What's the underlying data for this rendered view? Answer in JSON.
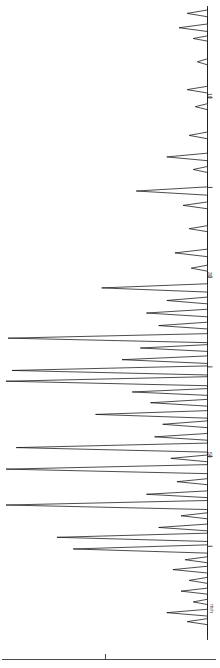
{
  "figure": {
    "orientation": "rotated-90-clockwise",
    "axis_title": "min",
    "baseline_color": "#1a1a1a",
    "trace_color": "#111111",
    "background": "#ffffff"
  },
  "axis": {
    "ticks": [
      {
        "label": "10",
        "t": 10,
        "show_label": true
      },
      {
        "label": "20",
        "t": 20,
        "show_label": false
      },
      {
        "label": "30",
        "t": 30,
        "show_label": true
      },
      {
        "label": "40",
        "t": 40,
        "show_label": false
      },
      {
        "label": "50",
        "t": 50,
        "show_label": true
      },
      {
        "label": "60",
        "t": 60,
        "show_label": false
      }
    ],
    "bottom_rule_tick": "0"
  },
  "chart_data": {
    "type": "line",
    "title": "",
    "subtitle": "",
    "xlabel": "min",
    "ylabel": "",
    "grid": false,
    "legend": "none",
    "orientation": "vertical-time-axis",
    "xlim": [
      0,
      70
    ],
    "ylim": [
      0,
      1
    ],
    "axis_ticks": [
      10,
      20,
      30,
      40,
      50,
      60
    ],
    "axis_tick_labels": [
      "10",
      "20",
      "30",
      "40",
      "50",
      "60"
    ],
    "series": [
      {
        "name": "detector response",
        "peaks": [
          {
            "t": 0.6,
            "h": 0.1,
            "w": 0.9
          },
          {
            "t": 2.2,
            "h": 0.14,
            "w": 1.0
          },
          {
            "t": 3.4,
            "h": 0.07,
            "w": 0.7
          },
          {
            "t": 6.0,
            "h": 0.05,
            "w": 0.8
          },
          {
            "t": 9.1,
            "h": 0.1,
            "w": 0.9
          },
          {
            "t": 11.0,
            "h": 0.06,
            "w": 0.8
          },
          {
            "t": 14.2,
            "h": 0.09,
            "w": 0.9
          },
          {
            "t": 16.6,
            "h": 0.2,
            "w": 1.0
          },
          {
            "t": 18.0,
            "h": 0.07,
            "w": 0.8
          },
          {
            "t": 20.4,
            "h": 0.35,
            "w": 1.1
          },
          {
            "t": 22.0,
            "h": 0.12,
            "w": 0.9
          },
          {
            "t": 24.6,
            "h": 0.09,
            "w": 0.8
          },
          {
            "t": 27.3,
            "h": 0.16,
            "w": 1.0
          },
          {
            "t": 29.0,
            "h": 0.08,
            "w": 0.8
          },
          {
            "t": 31.2,
            "h": 0.52,
            "w": 1.1
          },
          {
            "t": 32.6,
            "h": 0.2,
            "w": 0.9
          },
          {
            "t": 34.0,
            "h": 0.3,
            "w": 1.0
          },
          {
            "t": 35.4,
            "h": 0.24,
            "w": 0.9
          },
          {
            "t": 36.8,
            "h": 0.98,
            "w": 1.2
          },
          {
            "t": 37.9,
            "h": 0.33,
            "w": 0.9
          },
          {
            "t": 39.2,
            "h": 0.42,
            "w": 1.0
          },
          {
            "t": 40.4,
            "h": 0.96,
            "w": 1.2
          },
          {
            "t": 41.6,
            "h": 0.99,
            "w": 1.2
          },
          {
            "t": 42.8,
            "h": 0.37,
            "w": 0.9
          },
          {
            "t": 44.0,
            "h": 0.28,
            "w": 0.9
          },
          {
            "t": 45.3,
            "h": 0.55,
            "w": 1.0
          },
          {
            "t": 46.4,
            "h": 0.22,
            "w": 0.9
          },
          {
            "t": 47.8,
            "h": 0.26,
            "w": 0.9
          },
          {
            "t": 49.0,
            "h": 0.94,
            "w": 1.2
          },
          {
            "t": 50.2,
            "h": 0.18,
            "w": 0.9
          },
          {
            "t": 51.4,
            "h": 0.99,
            "w": 1.2
          },
          {
            "t": 52.8,
            "h": 0.15,
            "w": 0.8
          },
          {
            "t": 54.2,
            "h": 0.3,
            "w": 0.9
          },
          {
            "t": 55.4,
            "h": 0.99,
            "w": 1.2
          },
          {
            "t": 56.6,
            "h": 0.13,
            "w": 0.8
          },
          {
            "t": 57.9,
            "h": 0.24,
            "w": 0.9
          },
          {
            "t": 59.0,
            "h": 0.74,
            "w": 1.1
          },
          {
            "t": 60.3,
            "h": 0.66,
            "w": 1.1
          },
          {
            "t": 61.5,
            "h": 0.11,
            "w": 0.8
          },
          {
            "t": 62.6,
            "h": 0.17,
            "w": 0.9
          },
          {
            "t": 63.8,
            "h": 0.09,
            "w": 0.8
          },
          {
            "t": 65.0,
            "h": 0.13,
            "w": 0.8
          },
          {
            "t": 66.2,
            "h": 0.07,
            "w": 0.7
          },
          {
            "t": 67.4,
            "h": 0.2,
            "w": 0.9
          },
          {
            "t": 68.4,
            "h": 0.1,
            "w": 0.8
          }
        ]
      }
    ]
  }
}
